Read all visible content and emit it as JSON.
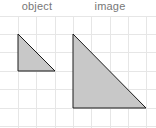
{
  "labels": {
    "object": "object",
    "image": "image"
  },
  "colors": {
    "grid": "#e6e6e6",
    "fill": "#c8c8c8",
    "stroke": "#1a1a1a",
    "label": "#777777"
  },
  "grid": {
    "cell_size": 18.4,
    "columns": 8,
    "rows": 7
  },
  "shapes": {
    "object_triangle": {
      "points": "18,34 18,71 55,71",
      "legs_in_cells": [
        2,
        2
      ]
    },
    "image_triangle": {
      "points": "73,34 73,108 146,108",
      "legs_in_cells": [
        4,
        4
      ]
    }
  }
}
